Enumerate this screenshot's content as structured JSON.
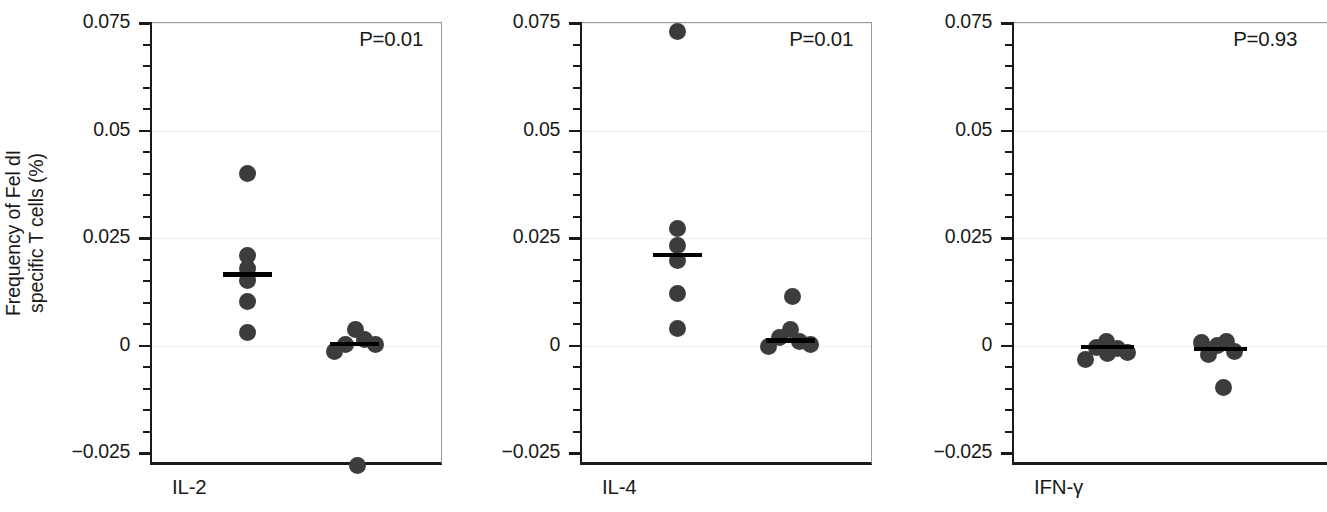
{
  "figure": {
    "width": 1327,
    "height": 512,
    "background": "#ffffff",
    "dot_color": "#3c3c3c",
    "axis_color": "#1a1a1a",
    "grid_color": "#ececec",
    "median_color": "#000000"
  },
  "axis": {
    "ylabel_line1": "Frequency of Fel dI",
    "ylabel_line2": "specific T cells (%)",
    "ylabel": "Frequency of Fel dI specific T cells (%)",
    "ymin": -0.025,
    "ymax": 0.075,
    "major_ticks": [
      0.075,
      0.05,
      0.025,
      0,
      -0.025
    ],
    "tick_labels": [
      "0.075",
      "0.05",
      "0.025",
      "0",
      "−0.025"
    ],
    "minor_tick_step": 0.005
  },
  "chart_data": {
    "type": "scatter",
    "title": "",
    "xlabel": "",
    "ylabel": "Frequency of Fel dI specific T cells (%)",
    "ylim": [
      -0.025,
      0.075
    ],
    "grid": true,
    "legend": "none",
    "panels": [
      {
        "name": "IL-2",
        "label": "IL-2",
        "pvalue_label": "P=0.01",
        "pvalue": 0.01,
        "groups": [
          {
            "name": "group-left",
            "x_center": 0.33,
            "median": 0.0165,
            "values": [
              0.04,
              0.021,
              0.0178,
              0.0152,
              0.0103,
              0.003
            ],
            "offsets": [
              0,
              0,
              0,
              0,
              0,
              0
            ]
          },
          {
            "name": "group-right",
            "x_center": 0.7,
            "median": 0.0003,
            "values": [
              -0.0014,
              0.0002,
              0.0038,
              0.0013,
              0.0003,
              -0.028
            ],
            "offsets": [
              -0.068,
              -0.03,
              0.005,
              0.036,
              0.072,
              0.012
            ]
          }
        ]
      },
      {
        "name": "IL-4",
        "label": "IL-4",
        "pvalue_label": "P=0.01",
        "pvalue": 0.01,
        "groups": [
          {
            "name": "group-left",
            "x_center": 0.33,
            "median": 0.021,
            "values": [
              0.073,
              0.0272,
              0.0232,
              0.0197,
              0.012,
              0.004
            ],
            "offsets": [
              0,
              0,
              0,
              0,
              0,
              0
            ]
          },
          {
            "name": "group-right",
            "x_center": 0.72,
            "median": 0.0012,
            "values": [
              0.0113,
              -0.0002,
              0.0018,
              0.0038,
              0.001,
              0.0003
            ],
            "offsets": [
              0.01,
              -0.074,
              -0.036,
              0.0,
              0.034,
              0.072
            ]
          }
        ]
      },
      {
        "name": "IFN-γ",
        "label": "IFN-γ",
        "pvalue_label": "P=0.93",
        "pvalue": 0.93,
        "groups": [
          {
            "name": "group-left",
            "x_center": 0.3,
            "median": -0.0003,
            "values": [
              -0.0032,
              -0.0004,
              0.001,
              -0.0018,
              -0.0007,
              -0.0017
            ],
            "offsets": [
              -0.072,
              -0.036,
              -0.004,
              -0.002,
              0.03,
              0.064
            ]
          },
          {
            "name": "group-right",
            "x_center": 0.66,
            "median": -0.0008,
            "values": [
              0.0007,
              -0.002,
              -0.0001,
              0.001,
              -0.0013,
              -0.0098
            ],
            "offsets": [
              -0.06,
              -0.04,
              -0.01,
              0.018,
              0.046,
              0.008
            ]
          }
        ]
      }
    ]
  },
  "panel_geometry": [
    {
      "ticklabels_left": 44,
      "plot_left": 150,
      "plot_width": 292,
      "xlabel_left": 172,
      "pvalue_right": 18,
      "clipped": false
    },
    {
      "ticklabels_left": 474,
      "plot_left": 580,
      "plot_width": 292,
      "xlabel_left": 602,
      "pvalue_right": 18,
      "clipped": false
    },
    {
      "ticklabels_left": 906,
      "plot_left": 1012,
      "plot_width": 315,
      "xlabel_left": 1034,
      "pvalue_right": 30,
      "clipped": true
    }
  ]
}
